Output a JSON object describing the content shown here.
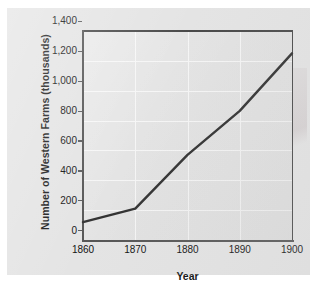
{
  "chart_data": {
    "type": "line",
    "title": "",
    "xlabel": "Year",
    "ylabel": "Number of Western Farms (thousands)",
    "x": [
      1860,
      1870,
      1880,
      1890,
      1900
    ],
    "values": [
      120,
      210,
      570,
      865,
      1250
    ],
    "xtick_labels": [
      "1860",
      "1870",
      "1880",
      "1890",
      "1900"
    ],
    "ytick_labels": [
      "0",
      "200",
      "400",
      "600",
      "800",
      "1,000",
      "1,200",
      "1,400"
    ],
    "ytick_values": [
      0,
      200,
      400,
      600,
      800,
      1000,
      1200,
      1400
    ],
    "xlim": [
      1860,
      1900
    ],
    "ylim": [
      0,
      1400
    ],
    "grid": true,
    "legend": "none",
    "series": [
      {
        "name": "Number of Western Farms (thousands)",
        "values": [
          120,
          210,
          570,
          865,
          1250
        ]
      }
    ],
    "line_color": "#333333",
    "plot_background": "#e0e0e0",
    "gridline_color": "#f4f4f4",
    "axis_color": "#565656",
    "panel_background": "#e4e4e4"
  },
  "axis": {
    "x_title": "Year",
    "y_title": "Number of Western Farms (thousands)"
  }
}
